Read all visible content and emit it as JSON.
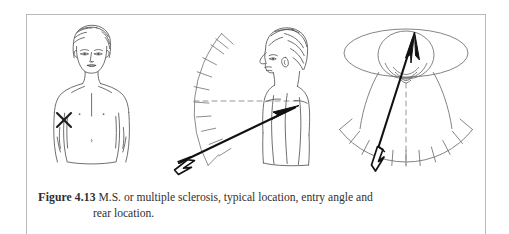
{
  "page": {
    "background_color": "#ffffff",
    "frame_color": "#b9b9b9",
    "ink_color": "#3a3a3a",
    "arrow_color": "#111111"
  },
  "caption": {
    "figure_label": "Figure 4.13",
    "figure_label_first_letter": "F",
    "figure_label_rest": "igure 4.13",
    "text_line1": "M.S. or multiple sclerosis, typical location, entry angle and",
    "text_line2": "rear location.",
    "full_text": "Figure 4.13  M.S. or multiple sclerosis, typical location, entry angle and rear location."
  },
  "figure": {
    "panels": [
      {
        "id": "front-view",
        "name": "frontal-torso-with-x-mark",
        "description": "Front view of head and torso with an X mark on the lower left abdomen",
        "marker": "X",
        "marker_label": "x-mark"
      },
      {
        "id": "side-view",
        "name": "profile-with-entry-angle-protractor",
        "description": "Side profile of head and torso with protractor arc, dashed horizontal reference line and entry arrow",
        "protractor_ticks": 13,
        "reference_line_style": "dashed",
        "arrow_label": "entry-angle-arrow"
      },
      {
        "id": "rear-view",
        "name": "overhead-rear-location-diagram",
        "description": "Overhead/rear view with horizontal plane ellipse, head circle, lower arc with ticks, dashed vertical centerline and arrow",
        "protractor_ticks": 11,
        "centerline_style": "dashed",
        "arrow_label": "rear-location-arrow"
      }
    ]
  }
}
